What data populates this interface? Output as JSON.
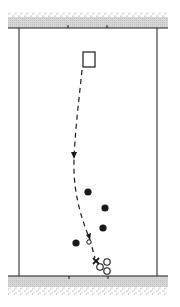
{
  "diagram": {
    "type": "play-diagram",
    "colors": {
      "ink": "#1a1a1a",
      "band": "#cfcfcf",
      "speckle": "#6a6a6a",
      "background": "#ffffff"
    },
    "court": {
      "left_wall_x": 19,
      "right_wall_x": 157,
      "top_line_y": 28,
      "bottom_line_y": 276,
      "band_left_x": 8,
      "band_right_x": 168
    },
    "top_ticks_x": [
      68,
      107
    ],
    "bottom_ticks_x": [
      69,
      108
    ],
    "start_marker": {
      "shape": "rectangle",
      "x": 83,
      "y": 52,
      "w": 12,
      "h": 15
    },
    "path": {
      "style": "dashed",
      "arrows_at": [
        [
          74,
          156
        ],
        [
          90,
          240
        ]
      ]
    },
    "filled_players": [
      [
        88,
        192
      ],
      [
        105,
        208
      ],
      [
        103,
        228
      ],
      [
        76,
        243
      ]
    ],
    "small_open_marker": [
      89,
      242
    ],
    "x_marker": [
      96,
      261
    ],
    "open_players": [
      [
        100,
        267
      ],
      [
        107,
        262
      ],
      [
        107,
        272
      ]
    ]
  }
}
